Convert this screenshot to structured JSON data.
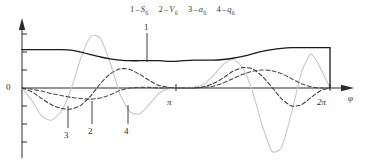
{
  "figure": {
    "title": "",
    "legend_items": [
      {
        "index": "1",
        "dash": "–",
        "symbol": "S",
        "subscript": "б"
      },
      {
        "index": "2",
        "dash": "–",
        "symbol": "V",
        "subscript": "б"
      },
      {
        "index": "3",
        "dash": "–",
        "symbol": "a",
        "subscript": "б"
      },
      {
        "index": "4",
        "dash": "–",
        "symbol": "q",
        "subscript": "б"
      }
    ],
    "axis": {
      "x_label": "φ",
      "y_zero_label": "0",
      "x_ticks": [
        {
          "label": "π",
          "value": 3.14159
        },
        {
          "label": "2π",
          "value": 6.28319
        }
      ]
    },
    "curve_labels": [
      {
        "id": "1",
        "text": "1"
      },
      {
        "id": "2",
        "text": "2"
      },
      {
        "id": "3",
        "text": "3"
      },
      {
        "id": "4",
        "text": "4"
      }
    ],
    "colors": {
      "curve_1_solid": "#1a1a1a",
      "curve_2_dashed": "#4a4a4a",
      "curve_3_dashed": "#3a3a3a",
      "curve_4_light": "#c9c9c9",
      "axis": "#2b2b2b",
      "background": "#ffffff"
    }
  },
  "chart_data": {
    "type": "line",
    "title": "",
    "xlabel": "φ",
    "ylabel": "",
    "xlim": [
      0,
      6.28319
    ],
    "ylim": [
      -1.15,
      1.0
    ],
    "grid": false,
    "legend_position": "top-center",
    "x_tick_labels": [
      "0",
      "π",
      "2π"
    ],
    "x_tick_values": [
      0,
      3.14159,
      6.28319
    ],
    "x": [
      0.0,
      0.2,
      0.4,
      0.6,
      0.8,
      1.0,
      1.2,
      1.4,
      1.6,
      1.8,
      2.0,
      2.2,
      2.4,
      2.6,
      2.8,
      3.0,
      3.14159,
      3.3,
      3.5,
      3.7,
      3.9,
      4.1,
      4.3,
      4.5,
      4.7,
      4.9,
      5.1,
      5.3,
      5.5,
      5.7,
      5.9,
      6.1,
      6.28319
    ],
    "series": [
      {
        "name": "Sб",
        "label_index": "1",
        "style": "solid",
        "color": "#1a1a1a",
        "values": [
          0.62,
          0.62,
          0.62,
          0.62,
          0.62,
          0.61,
          0.58,
          0.54,
          0.5,
          0.47,
          0.45,
          0.44,
          0.44,
          0.44,
          0.44,
          0.43,
          0.43,
          0.44,
          0.45,
          0.45,
          0.45,
          0.46,
          0.48,
          0.51,
          0.55,
          0.59,
          0.62,
          0.64,
          0.65,
          0.65,
          0.65,
          0.65,
          0.65
        ]
      },
      {
        "name": "Vб",
        "label_index": "2",
        "style": "dashed",
        "color": "#4a4a4a",
        "values": [
          0.0,
          -0.02,
          -0.05,
          -0.09,
          -0.12,
          -0.15,
          -0.17,
          -0.18,
          -0.16,
          -0.11,
          -0.04,
          0.0,
          0.01,
          0.01,
          0.0,
          0.0,
          0.0,
          0.0,
          0.0,
          0.01,
          0.03,
          0.08,
          0.15,
          0.22,
          0.27,
          0.29,
          0.28,
          0.23,
          0.15,
          0.07,
          0.02,
          0.0,
          0.0
        ]
      },
      {
        "name": "aб",
        "label_index": "3",
        "style": "dashed",
        "color": "#3a3a3a",
        "values": [
          0.0,
          -0.06,
          -0.17,
          -0.27,
          -0.33,
          -0.34,
          -0.28,
          -0.13,
          0.07,
          0.23,
          0.31,
          0.3,
          0.22,
          0.12,
          0.04,
          0.01,
          0.0,
          0.0,
          0.0,
          0.02,
          0.07,
          0.16,
          0.27,
          0.33,
          0.31,
          0.19,
          0.01,
          -0.18,
          -0.29,
          -0.27,
          -0.15,
          -0.04,
          0.0
        ]
      },
      {
        "name": "qб",
        "label_index": "4",
        "style": "light",
        "color": "#c9c9c9",
        "values": [
          0.0,
          -0.2,
          -0.45,
          -0.52,
          -0.38,
          -0.02,
          0.48,
          0.83,
          0.8,
          0.4,
          -0.1,
          -0.38,
          -0.42,
          -0.26,
          -0.08,
          -0.01,
          0.0,
          0.0,
          0.01,
          0.06,
          0.2,
          0.38,
          0.46,
          0.33,
          -0.05,
          -0.6,
          -1.02,
          -0.95,
          -0.4,
          0.25,
          0.55,
          0.3,
          0.0
        ]
      }
    ]
  }
}
